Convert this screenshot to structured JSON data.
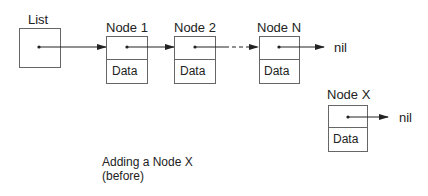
{
  "diagram": {
    "list_label": "List",
    "nodes": [
      {
        "label": "Node 1",
        "field": "Data"
      },
      {
        "label": "Node 2",
        "field": "Data"
      },
      {
        "label": "Node N",
        "field": "Data"
      }
    ],
    "new_node": {
      "label": "Node X",
      "field": "Data"
    },
    "terminators": [
      "nil",
      "nil"
    ],
    "caption_line1": "Adding a Node X",
    "caption_line2": "(before)"
  },
  "colors": {
    "stroke": "#555555",
    "text": "#222222",
    "background": "#ffffff"
  }
}
